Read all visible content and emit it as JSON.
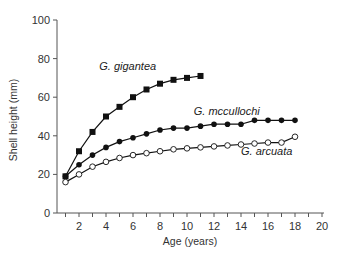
{
  "chart_data": {
    "type": "line",
    "title": "",
    "xlabel": "Age (years)",
    "ylabel": "Shell height (mm)",
    "xlim": [
      0.5,
      20
    ],
    "ylim": [
      0,
      100
    ],
    "x_ticks": [
      2,
      4,
      6,
      8,
      10,
      12,
      14,
      16,
      18,
      20
    ],
    "y_ticks": [
      0,
      20,
      40,
      60,
      80,
      100
    ],
    "grid": false,
    "legend": "inline labels",
    "series": [
      {
        "name": "G. gigantea",
        "marker": "filled-square",
        "x": [
          1,
          2,
          3,
          4,
          5,
          6,
          7,
          8,
          9,
          10,
          11
        ],
        "values": [
          19,
          32,
          42,
          50,
          55,
          60,
          64,
          67,
          69,
          70,
          71
        ],
        "label_pos": {
          "x": 3.5,
          "y": 74
        }
      },
      {
        "name": "G. mccullochi",
        "marker": "filled-circle",
        "x": [
          1,
          2,
          3,
          4,
          5,
          6,
          7,
          8,
          9,
          10,
          11,
          12,
          13,
          14,
          15,
          16,
          17,
          18
        ],
        "values": [
          19,
          25,
          30,
          34,
          37,
          39,
          41,
          43,
          44,
          44,
          45,
          46,
          46,
          46,
          48,
          48,
          48,
          48
        ],
        "label_pos": {
          "x": 10.5,
          "y": 51
        }
      },
      {
        "name": "G. arcuata",
        "marker": "open-circle",
        "x": [
          1,
          2,
          3,
          4,
          5,
          6,
          7,
          8,
          9,
          10,
          11,
          12,
          13,
          14,
          15,
          16,
          17,
          18
        ],
        "values": [
          16,
          20,
          24,
          26.5,
          28.5,
          30,
          31,
          32,
          33,
          33.5,
          34,
          34.5,
          35,
          35.5,
          36,
          36.5,
          36.5,
          39.5
        ],
        "label_pos": {
          "x": 14,
          "y": 30
        }
      }
    ]
  }
}
